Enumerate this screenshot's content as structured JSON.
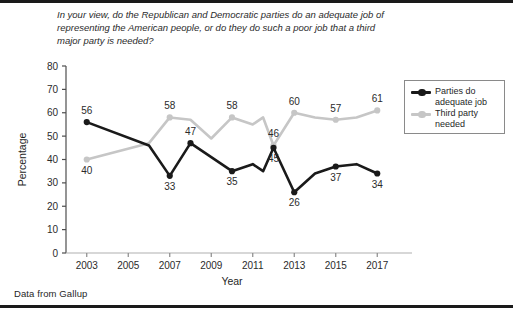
{
  "figure": {
    "question": "In your view, do the Republican and Democratic parties do an adequate job of representing the American people, or do they do such a poor job that a third major party is needed?",
    "source_note": "Data from Gallup"
  },
  "legend": {
    "position": "top-right-inside",
    "entries": [
      {
        "name": "parties-adequate",
        "label": "Parties do adequate job",
        "color": "#1a1a1a"
      },
      {
        "name": "third-party",
        "label": "Third party needed",
        "color": "#c6c6c6"
      }
    ]
  },
  "chart_data": {
    "type": "line",
    "title": "In your view, do the Republican and Democratic parties do an adequate job of representing the American people, or do they do such a poor job that a third major party is needed?",
    "xlabel": "Year",
    "ylabel": "Percentage",
    "xlim": [
      2002,
      2018
    ],
    "ylim": [
      0,
      80
    ],
    "ytick_step": 10,
    "yticks": [
      0,
      10,
      20,
      30,
      40,
      50,
      60,
      70,
      80
    ],
    "xticks": [
      2003,
      2005,
      2007,
      2009,
      2011,
      2013,
      2015,
      2017
    ],
    "xtick_labels": [
      "2003",
      "2005",
      "2007",
      "2009",
      "2011",
      "2013",
      "2015",
      "2017"
    ],
    "grid": false,
    "legend_position": "upper right",
    "series": [
      {
        "name": "Parties do adequate job",
        "color": "#1a1a1a",
        "x": [
          2003,
          2006,
          2007,
          2008,
          2010,
          2011,
          2011.5,
          2012,
          2013,
          2014,
          2015,
          2016,
          2017
        ],
        "values": [
          56,
          46,
          33,
          47,
          35,
          38,
          35,
          45,
          26,
          34,
          37,
          38,
          34
        ],
        "labeled_points": [
          {
            "x": 2003,
            "value": 56,
            "label": "56",
            "side": "above"
          },
          {
            "x": 2007,
            "value": 33,
            "label": "33",
            "side": "below"
          },
          {
            "x": 2008,
            "value": 47,
            "label": "47",
            "side": "above"
          },
          {
            "x": 2010,
            "value": 35,
            "label": "35",
            "side": "below"
          },
          {
            "x": 2012,
            "value": 45,
            "label": "45",
            "side": "below"
          },
          {
            "x": 2013,
            "value": 26,
            "label": "26",
            "side": "below"
          },
          {
            "x": 2015,
            "value": 37,
            "label": "37",
            "side": "below"
          },
          {
            "x": 2017,
            "value": 34,
            "label": "34",
            "side": "below"
          }
        ]
      },
      {
        "name": "Third party needed",
        "color": "#c6c6c6",
        "x": [
          2003,
          2006,
          2007,
          2008,
          2009,
          2010,
          2011,
          2011.5,
          2012,
          2013,
          2014,
          2015,
          2016,
          2017
        ],
        "values": [
          40,
          47,
          58,
          57,
          49,
          58,
          55,
          58,
          46,
          60,
          58,
          57,
          58,
          61
        ],
        "labeled_points": [
          {
            "x": 2003,
            "value": 40,
            "label": "40",
            "side": "below"
          },
          {
            "x": 2007,
            "value": 58,
            "label": "58",
            "side": "above"
          },
          {
            "x": 2010,
            "value": 58,
            "label": "58",
            "side": "above"
          },
          {
            "x": 2012,
            "value": 46,
            "label": "46",
            "side": "above"
          },
          {
            "x": 2013,
            "value": 60,
            "label": "60",
            "side": "above"
          },
          {
            "x": 2015,
            "value": 57,
            "label": "57",
            "side": "above"
          },
          {
            "x": 2017,
            "value": 61,
            "label": "61",
            "side": "above"
          }
        ]
      }
    ]
  }
}
